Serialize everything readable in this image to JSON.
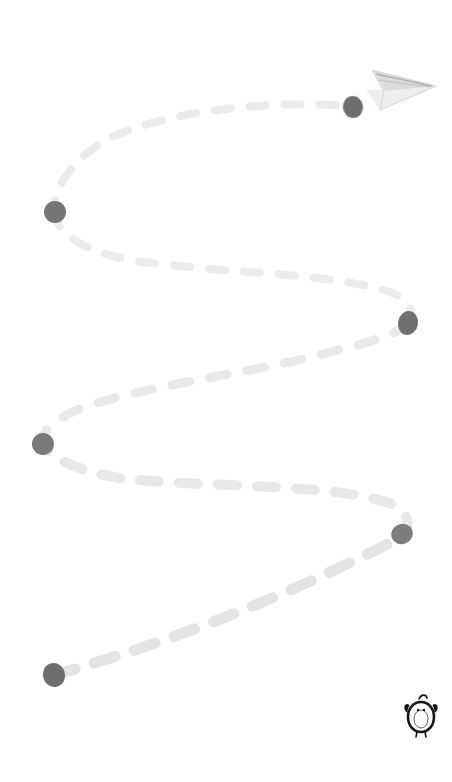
{
  "canvas": {
    "width": 452,
    "height": 782,
    "background": "#ffffff",
    "title": "Dashed flight path with paper airplane"
  },
  "palette": {
    "background": "#ffffff",
    "dash": "#e8e8e8",
    "dash_strong": "#dedede",
    "waypoint": "#7d7d7d",
    "waypoint_dark": "#6e6e6e",
    "airplane_body": "#eceaea",
    "airplane_shade": "#d8d6d6",
    "airplane_line": "#b8b6b6",
    "logo": "#1a1a1a"
  },
  "path": {
    "name": "serpentine-dashed-route",
    "stroke_color": "#e8e8e8",
    "stroke_width": 9,
    "dash_pattern": "16 18",
    "direction": "bottom-left to top-right",
    "segments": [
      {
        "d": "M 54 675 C 150 648, 250 610, 330 572 C 372 552, 395 542, 402 534"
      },
      {
        "d": "M 402 534 C 412 524, 408 512, 392 504 C 330 482, 200 488, 120 478 C 80 472, 52 458, 44 446"
      },
      {
        "d": "M 44 446 C 38 434, 52 420, 82 408 C 150 384, 260 372, 330 352 C 380 340, 400 332, 407 324"
      },
      {
        "d": "M 407 324 C 416 314, 410 300, 390 292 C 330 272, 200 272, 130 260 C 88 252, 60 236, 55 216"
      },
      {
        "d": "M 55 216 C 50 196, 68 160, 110 138 C 170 110, 270 100, 350 106"
      }
    ]
  },
  "waypoints": [
    {
      "id": "waypoint-start",
      "label": "Start",
      "x": 54,
      "y": 675,
      "rx": 11,
      "ry": 12,
      "rotate": -18,
      "color": "#6e6e6e"
    },
    {
      "id": "waypoint-2",
      "label": "Waypoint 2",
      "x": 402,
      "y": 534,
      "rx": 11,
      "ry": 10,
      "rotate": -22,
      "color": "#7d7d7d"
    },
    {
      "id": "waypoint-3",
      "label": "Waypoint 3",
      "x": 43,
      "y": 444,
      "rx": 11,
      "ry": 11,
      "rotate": 8,
      "color": "#7a7a7a"
    },
    {
      "id": "waypoint-4",
      "label": "Waypoint 4",
      "x": 408,
      "y": 323,
      "rx": 10,
      "ry": 12,
      "rotate": 10,
      "color": "#6f6f6f"
    },
    {
      "id": "waypoint-5",
      "label": "Waypoint 5",
      "x": 55,
      "y": 212,
      "rx": 11,
      "ry": 11,
      "rotate": 0,
      "color": "#747474"
    },
    {
      "id": "waypoint-end",
      "label": "Destination",
      "x": 353,
      "y": 107,
      "rx": 10,
      "ry": 11,
      "rotate": -8,
      "color": "#6e6e6e"
    }
  ],
  "airplane": {
    "name": "paper-airplane-icon",
    "label": "Paper airplane",
    "x": 363,
    "y": 60,
    "width": 76,
    "height": 52,
    "heading": "right",
    "body_color": "#eceaea",
    "shade_color": "#d9d7d7",
    "line_color": "#b9b7b7"
  },
  "logo": {
    "name": "penguin-logo",
    "label": "Penguin",
    "x": 406,
    "y": 694,
    "width": 30,
    "height": 42,
    "color": "#161616"
  }
}
